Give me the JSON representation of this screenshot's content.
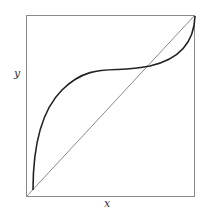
{
  "figure": {
    "x_label": "x",
    "y_label": "y",
    "frame": {
      "x0": 26.5,
      "y0": 15.5,
      "x1": 194.5,
      "y1": 196.5,
      "color": "#8a8a8a"
    },
    "diagonal": {
      "from": [
        26.5,
        196.5
      ],
      "to": [
        194.5,
        15.5
      ],
      "color": "#8a8a8a"
    },
    "curve": {
      "color": "#222222",
      "description": "S-shaped curve starting at lower-left near diagonal, rising steeply above diagonal, flattening to a plateau, crossing diagonal, then rising steeply to top-right corner",
      "path": "M33,190 C33,150 40,112 62,90 C82,70 100,70 118,69.5 C133,69 140,68 150,66 C172,61 194,48 195,16"
    }
  }
}
